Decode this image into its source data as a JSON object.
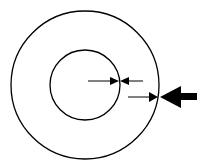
{
  "diagram": {
    "background": "#ffffff",
    "stroke": "#000000",
    "outer_circle": {
      "cx": 85,
      "cy": 85,
      "r": 74
    },
    "inner_circle": {
      "cx": 85,
      "cy": 85,
      "r": 35
    },
    "arrows": [
      {
        "name": "inner-right-arrow",
        "from": [
          88,
          81
        ],
        "to": [
          118,
          81
        ],
        "size": "small"
      },
      {
        "name": "inner-left-arrow",
        "from": [
          143,
          81
        ],
        "to": [
          121,
          81
        ],
        "size": "small"
      },
      {
        "name": "outer-right-arrow",
        "from": [
          128,
          97
        ],
        "to": [
          157,
          97
        ],
        "size": "small"
      },
      {
        "name": "outer-left-thick-arrow",
        "from": [
          197,
          97
        ],
        "to": [
          160,
          97
        ],
        "size": "large"
      }
    ]
  }
}
